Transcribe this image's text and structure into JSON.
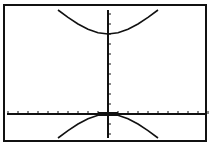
{
  "chart_data": {
    "type": "line",
    "title": "",
    "xlabel": "",
    "ylabel": "",
    "grid": false,
    "legend": null,
    "axis_ticks_spacing": 1,
    "xlim": [
      -10,
      10
    ],
    "ylim": [
      -2.4,
      10.4
    ],
    "equation": "(y-4)^2 - x^2 = 16",
    "series": [
      {
        "name": "upper branch",
        "x": [
          -5,
          -4,
          -3,
          -2,
          -1,
          0,
          1,
          2,
          3,
          4,
          5
        ],
        "y": [
          10.4,
          9.66,
          9.0,
          8.47,
          8.12,
          8.0,
          8.12,
          8.47,
          9.0,
          9.66,
          10.4
        ]
      },
      {
        "name": "lower branch",
        "x": [
          -5,
          -4,
          -3,
          -2,
          -1,
          0,
          1,
          2,
          3,
          4,
          5
        ],
        "y": [
          -2.4,
          -1.66,
          -1.0,
          -0.47,
          -0.12,
          0.0,
          -0.12,
          -0.47,
          -1.0,
          -1.66,
          -2.4
        ]
      }
    ],
    "colors": {
      "background": "#ffffff",
      "ink": "#111111"
    }
  }
}
